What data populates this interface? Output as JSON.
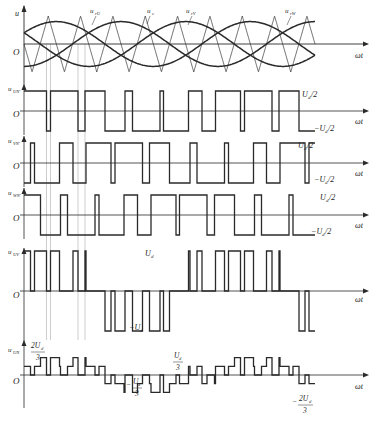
{
  "figure": {
    "colors": {
      "ink": "#2a2a2a",
      "guide": "#b8b8b8",
      "background": "#ffffff"
    },
    "x_axis_label": "ωt",
    "origin_label": "O"
  },
  "chart_data": {
    "type": "line",
    "carrier_periods": 9,
    "modulation_index": 0.8,
    "fundamental_periods": 1.5,
    "panels": [
      {
        "id": "reference",
        "ylabel": "u",
        "curve_labels": [
          "u_rU",
          "u_c",
          "u_rV",
          "u_rW"
        ],
        "series": [
          {
            "name": "u_rU",
            "kind": "sine",
            "phase_deg": 0
          },
          {
            "name": "u_rV",
            "kind": "sine",
            "phase_deg": -120
          },
          {
            "name": "u_rW",
            "kind": "sine",
            "phase_deg": 120
          },
          {
            "name": "u_c",
            "kind": "triangle"
          }
        ]
      },
      {
        "id": "uUN'",
        "ylabel": "u_UN'",
        "levels": [
          "U_d/2",
          "-U_d/2"
        ]
      },
      {
        "id": "uVN'",
        "ylabel": "u_VN'",
        "levels": [
          "U_d/2",
          "-U_d/2"
        ]
      },
      {
        "id": "uWN'",
        "ylabel": "u_WN'",
        "levels": [
          "U_d/2",
          "-U_d/2"
        ]
      },
      {
        "id": "uUV",
        "ylabel": "u_UV",
        "levels": [
          "U_d",
          "-U_d"
        ]
      },
      {
        "id": "uUN",
        "ylabel": "u_UN",
        "levels": [
          "2U_d/3",
          "U_d/3",
          "-U_d/3",
          "-2U_d/3"
        ]
      }
    ]
  },
  "labels": {
    "ref_axis": "u",
    "curve_u_rU": "u",
    "curve_u_rU_sub": "rU",
    "curve_u_c": "u",
    "curve_u_c_sub": "c",
    "curve_u_rV": "u",
    "curve_u_rV_sub": "rV",
    "curve_u_rW": "u",
    "curve_u_rW_sub": "rW",
    "uUNp": "u",
    "uUNp_sub": "UN'",
    "uVNp": "u",
    "uVNp_sub": "VN'",
    "uWNp": "u",
    "uWNp_sub": "WN'",
    "uUV": "u",
    "uUV_sub": "UV",
    "uUN": "u",
    "uUN_sub": "UN",
    "half_pos": "U",
    "half_pos_sub": "d",
    "half_pos_tail": "/2",
    "half_neg": "−U",
    "half_neg_sub": "d",
    "half_neg_tail": "/2",
    "ud_pos": "U",
    "ud_pos_sub": "d",
    "ud_neg": "−U",
    "ud_neg_sub": "d",
    "two_third_num": "2U",
    "two_third_sub": "d",
    "den3": "3",
    "one_third_num": "U",
    "one_third_sub": "d",
    "neg_sign": "−",
    "origin": "O",
    "omega_t": "ωt"
  }
}
